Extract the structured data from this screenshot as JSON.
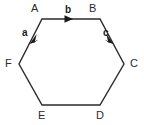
{
  "diagram": {
    "type": "hexagon-vector-diagram",
    "shape": "regular hexagon",
    "stroke_color": "#2b2b2b",
    "fill_color": "none",
    "background_color": "#ffffff",
    "vertices": [
      {
        "id": "A",
        "label": "A",
        "x": 42,
        "y": 19
      },
      {
        "id": "B",
        "label": "B",
        "x": 100,
        "y": 19
      },
      {
        "id": "C",
        "label": "C",
        "x": 124,
        "y": 64
      },
      {
        "id": "D",
        "label": "D",
        "x": 100,
        "y": 105
      },
      {
        "id": "E",
        "label": "E",
        "x": 42,
        "y": 105
      },
      {
        "id": "F",
        "label": "F",
        "x": 19,
        "y": 64
      }
    ],
    "edges": [
      {
        "from": "A",
        "to": "B",
        "vector_label": "b",
        "has_arrow": true,
        "arrow_at": {
          "x": 71,
          "y": 19
        },
        "direction": "right"
      },
      {
        "from": "B",
        "to": "C",
        "vector_label": "c",
        "has_arrow": true,
        "arrow_at": {
          "x": 112,
          "y": 41
        },
        "direction": "down-right"
      },
      {
        "from": "C",
        "to": "D",
        "vector_label": "",
        "has_arrow": false,
        "direction": "down-left"
      },
      {
        "from": "D",
        "to": "E",
        "vector_label": "",
        "has_arrow": false,
        "direction": "left"
      },
      {
        "from": "E",
        "to": "F",
        "vector_label": "",
        "has_arrow": false,
        "direction": "up-left"
      },
      {
        "from": "F",
        "to": "A",
        "vector_label": "a",
        "has_arrow": true,
        "arrow_at": {
          "x": 31,
          "y": 41
        },
        "direction": "down-left"
      }
    ],
    "vector_labels": [
      {
        "id": "a",
        "label": "a"
      },
      {
        "id": "b",
        "label": "b"
      },
      {
        "id": "c",
        "label": "c"
      }
    ]
  }
}
